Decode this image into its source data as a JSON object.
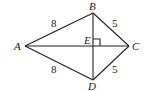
{
  "diagram": {
    "type": "kite",
    "points": {
      "A": {
        "label": "A",
        "x": 25,
        "y": 46
      },
      "B": {
        "label": "B",
        "x": 93,
        "y": 13
      },
      "C": {
        "label": "C",
        "x": 129,
        "y": 46
      },
      "D": {
        "label": "D",
        "x": 93,
        "y": 80
      },
      "E": {
        "label": "E",
        "x": 93,
        "y": 46
      }
    },
    "edges": [
      {
        "from": "A",
        "to": "B",
        "length_label": "8"
      },
      {
        "from": "B",
        "to": "C",
        "length_label": "5"
      },
      {
        "from": "A",
        "to": "D",
        "length_label": "8"
      },
      {
        "from": "D",
        "to": "C",
        "length_label": "5"
      },
      {
        "from": "A",
        "to": "C",
        "length_label": ""
      },
      {
        "from": "B",
        "to": "D",
        "length_label": ""
      }
    ],
    "right_angle_at": "E",
    "labels": {
      "A": "A",
      "B": "B",
      "C": "C",
      "D": "D",
      "E": "E",
      "AB": "8",
      "BC": "5",
      "AD": "8",
      "DC": "5"
    }
  }
}
